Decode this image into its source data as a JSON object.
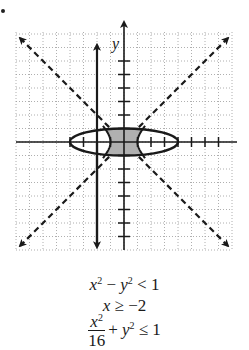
{
  "chart_data": {
    "type": "region",
    "title": "",
    "xlabel": "x",
    "ylabel": "y",
    "xlim": [
      -8,
      8
    ],
    "ylim": [
      -8,
      8
    ],
    "grid": true,
    "grid_style": "dotted",
    "tick_spacing": 1,
    "axis_ticks": {
      "x": [
        -4,
        -3,
        -2,
        -1,
        1,
        2,
        3,
        4,
        5,
        6,
        7
      ],
      "y": [
        -7,
        -6,
        -5,
        -4,
        -3,
        -2,
        -1,
        1,
        2,
        3,
        4,
        5,
        6
      ]
    },
    "inequalities": [
      {
        "expr": "x^2 - y^2 < 1",
        "boundary": "hyperbola x^2 - y^2 = 1",
        "line_style": "dashed",
        "asymptotes": [
          "y = x",
          "y = -x"
        ]
      },
      {
        "expr": "x >= -2",
        "boundary": "x = -2",
        "line_style": "solid"
      },
      {
        "expr": "x^2/16 + y^2 <= 1",
        "boundary": "ellipse, semi-axes a=4, b=1",
        "line_style": "solid"
      }
    ],
    "shaded_region": "Intersection: inside ellipse and between hyperbola branches (-1<x<1 approximately within |y|<=1)",
    "shade_color": "#b0b0b0"
  },
  "labels": {
    "y_axis": "y",
    "x_axis": "x"
  },
  "equations": [
    {
      "id": "eq1",
      "text": "x² − y² < 1"
    },
    {
      "id": "eq2",
      "text": "x ≥ −2"
    },
    {
      "id": "eq3",
      "text": "x²/16 + y² ≤ 1"
    }
  ],
  "colors": {
    "ink": "#1a1a1a",
    "grid": "#9a9a9a",
    "shade": "#b0b0b0",
    "background": "#ffffff"
  }
}
